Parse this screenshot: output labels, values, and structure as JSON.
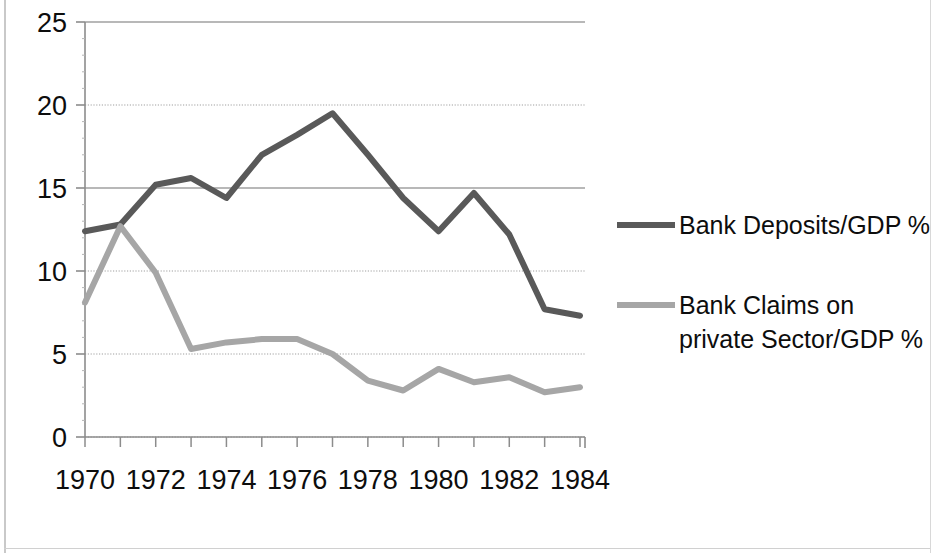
{
  "chart_data": {
    "type": "line",
    "title": "",
    "subtitle": "",
    "xlabel": "",
    "ylabel": "",
    "x": [
      1970,
      1971,
      1972,
      1973,
      1974,
      1975,
      1976,
      1977,
      1978,
      1979,
      1980,
      1981,
      1982,
      1983,
      1984
    ],
    "categories": [
      "1970",
      "1971",
      "1972",
      "1973",
      "1974",
      "1975",
      "1976",
      "1977",
      "1978",
      "1979",
      "1980",
      "1981",
      "1982",
      "1983",
      "1984"
    ],
    "series": [
      {
        "name": "Bank Deposits/GDP %",
        "color": "#595959",
        "values": [
          12.4,
          12.8,
          15.2,
          15.6,
          14.4,
          17.0,
          18.2,
          19.5,
          17.0,
          14.4,
          12.4,
          14.7,
          12.2,
          7.7,
          7.3
        ]
      },
      {
        "name": "Bank Claims on private Sector/GDP %",
        "color": "#a6a6a6",
        "values": [
          8.1,
          12.7,
          9.9,
          5.3,
          5.7,
          5.9,
          5.9,
          5.0,
          3.4,
          2.8,
          4.1,
          3.3,
          3.6,
          2.7,
          3.0
        ]
      }
    ],
    "xlim": [
      1970,
      1984
    ],
    "ylim": [
      0,
      25
    ],
    "ytick_labels": [
      "0",
      "5",
      "10",
      "15",
      "20",
      "25"
    ],
    "ytick_values": [
      0,
      5,
      10,
      15,
      20,
      25
    ],
    "xtick_labels": [
      "1970",
      "1972",
      "1974",
      "1976",
      "1978",
      "1980",
      "1982",
      "1984"
    ],
    "xtick_values": [
      1970,
      1972,
      1974,
      1976,
      1978,
      1980,
      1982,
      1984
    ],
    "xtick_minor_values": [
      1971,
      1973,
      1975,
      1977,
      1979,
      1981,
      1983
    ],
    "grid": "horizontal",
    "legend_position": "right",
    "legend_entries": [
      {
        "label_line1": "Bank Deposits/GDP %",
        "label_line2": "",
        "color": "#595959"
      },
      {
        "label_line1": "Bank Claims on",
        "label_line2": "private Sector/GDP %",
        "color": "#a6a6a6"
      }
    ]
  },
  "colors": {
    "series_dark": "#595959",
    "series_light": "#a6a6a6",
    "axis": "#8c8c8c",
    "gridline": "#a0a0a0",
    "text": "#0d0d0d",
    "background": "#ffffff"
  }
}
